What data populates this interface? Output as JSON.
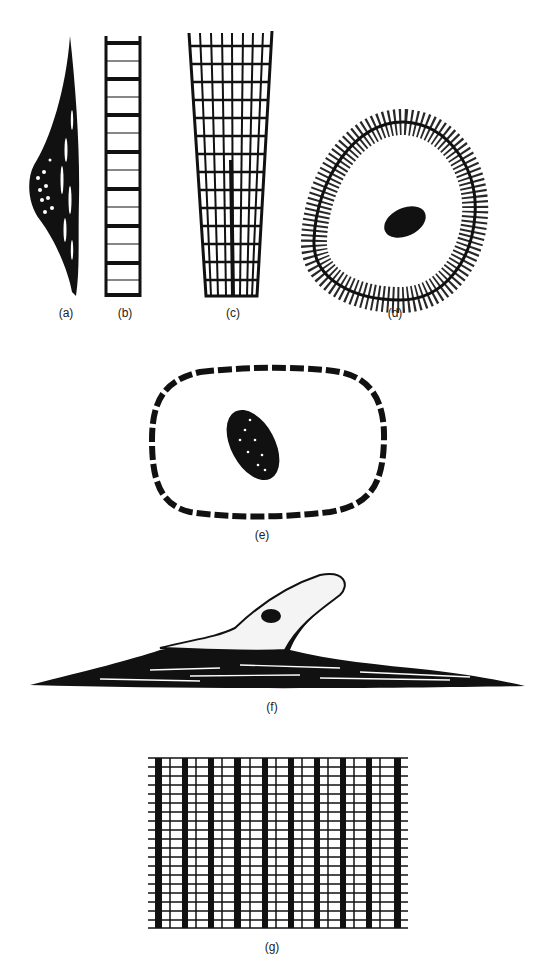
{
  "panels": [
    {
      "id": "a",
      "label": "(a)",
      "description": "spindle-shaped smooth muscle cell"
    },
    {
      "id": "b",
      "label": "(b)",
      "description": "striated fiber segment"
    },
    {
      "id": "c",
      "label": "(c)",
      "description": "tapering striated cardiac fiber"
    },
    {
      "id": "d",
      "label": "(d)",
      "description": "round cell with radial striations and central nucleus"
    },
    {
      "id": "e",
      "label": "(e)",
      "description": "oval cell with dashed border and granular nucleus"
    },
    {
      "id": "f",
      "label": "(f)",
      "description": "flattened cell with upward process and nucleus"
    },
    {
      "id": "g",
      "label": "(g)",
      "description": "striated grid pattern"
    }
  ],
  "colors": {
    "ink": "#111111",
    "background": "#ffffff"
  }
}
